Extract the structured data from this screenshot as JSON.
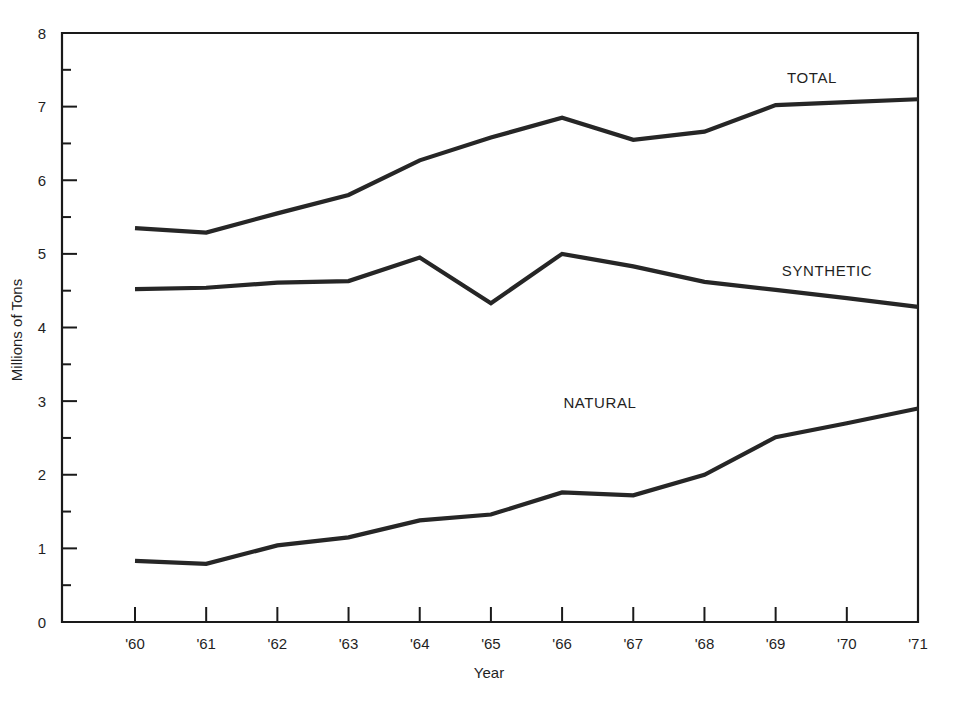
{
  "chart_data": {
    "type": "line",
    "title": "",
    "xlabel": "Year",
    "ylabel": "Millions of Tons",
    "categories": [
      "'60",
      "'61",
      "'62",
      "'63",
      "'64",
      "'65",
      "'66",
      "'67",
      "'68",
      "'69",
      "'70",
      "'71"
    ],
    "x_values": [
      1960,
      1961,
      1962,
      1963,
      1964,
      1965,
      1966,
      1967,
      1968,
      1969,
      1970,
      1971
    ],
    "xlim": [
      1960,
      1971
    ],
    "ylim": [
      0,
      8
    ],
    "y_ticks": [
      "0",
      "1",
      "2",
      "3",
      "4",
      "5",
      "6",
      "7",
      "8"
    ],
    "y_minor_ticks": [
      0.5,
      1.5,
      2.5,
      3.5,
      4.5,
      5.5,
      6.5,
      7.5
    ],
    "grid": false,
    "legend": "inline-series-labels",
    "series": [
      {
        "name": "TOTAL",
        "label": "TOTAL",
        "values": [
          5.35,
          5.29,
          5.55,
          5.8,
          6.27,
          6.58,
          6.85,
          6.55,
          6.66,
          7.02,
          7.06,
          7.1
        ]
      },
      {
        "name": "SYNTHETIC",
        "label": "SYNTHETIC",
        "values": [
          4.52,
          4.54,
          4.61,
          4.63,
          4.95,
          4.33,
          5.0,
          4.83,
          4.62,
          4.51,
          4.4,
          4.28
        ]
      },
      {
        "name": "NATURAL",
        "label": "NATURAL",
        "values": [
          0.83,
          0.79,
          1.04,
          1.15,
          1.38,
          1.46,
          1.76,
          1.72,
          2.0,
          2.51,
          2.7,
          2.9
        ]
      }
    ],
    "annotations": [
      {
        "text": "TOTAL",
        "near_x": "'69",
        "near_y": 7.25
      },
      {
        "text": "SYNTHETIC",
        "near_x": "'69",
        "near_y": 4.72
      },
      {
        "text": "NATURAL",
        "near_x": "'68",
        "near_y": 3.02
      }
    ],
    "colors": {
      "line": "#262626",
      "axis": "#1a1a1a",
      "text": "#1f1f1f",
      "background": "#ffffff"
    }
  }
}
